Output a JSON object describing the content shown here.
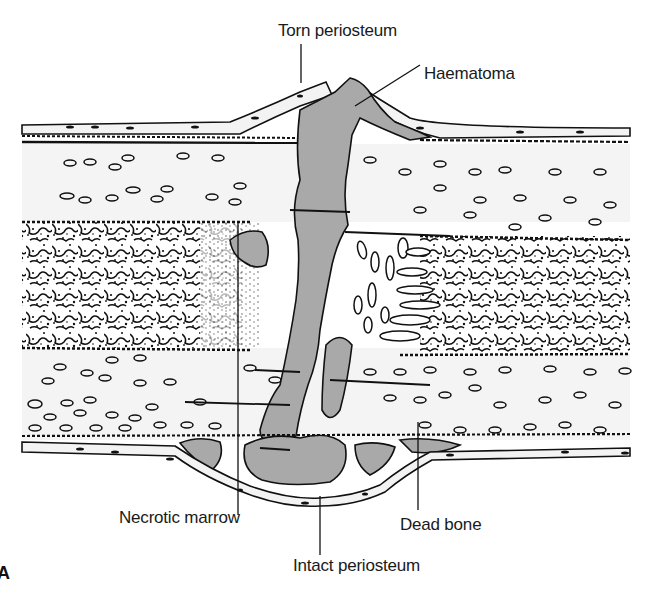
{
  "figure": {
    "panel_letter": "A",
    "colors": {
      "background": "#ffffff",
      "bone": "#f3f3f3",
      "haematoma": "#a9a9a9",
      "outline": "#111111",
      "marrow_ink": "#1a1a1a"
    }
  },
  "labels": {
    "torn_periosteum": "Torn periosteum",
    "haematoma": "Haematoma",
    "necrotic_marrow": "Necrotic marrow",
    "dead_bone": "Dead bone",
    "intact_periosteum": "Intact periosteum"
  }
}
